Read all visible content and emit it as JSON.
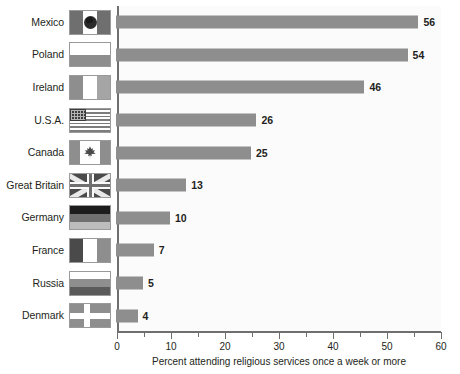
{
  "chart_data": {
    "type": "bar",
    "orientation": "horizontal",
    "title": "",
    "subtitle": "",
    "xlabel": "Percent attending religious services once a week or more",
    "ylabel": "",
    "xlim": [
      0,
      60
    ],
    "ylim": null,
    "grid": false,
    "legend": null,
    "x_ticks": [
      0,
      5,
      10,
      15,
      20,
      25,
      30,
      35,
      40,
      45,
      50,
      55,
      60
    ],
    "x_tick_labels": [
      "0",
      "",
      "10",
      "",
      "20",
      "",
      "30",
      "",
      "40",
      "",
      "50",
      "",
      "60"
    ],
    "bar_color": "#8e8e8e",
    "plot_background": "#fbfbfb",
    "axis_color": "#6f6f6f",
    "text_color": "#231f20",
    "categories": [
      "Mexico",
      "Poland",
      "Ireland",
      "U.S.A.",
      "Canada",
      "Great Britain",
      "Germany",
      "France",
      "Russia",
      "Denmark"
    ],
    "values": [
      56,
      54,
      46,
      26,
      25,
      13,
      10,
      7,
      5,
      4
    ],
    "data_labels": [
      "56",
      "54",
      "46",
      "26",
      "25",
      "13",
      "10",
      "7",
      "5",
      "4"
    ],
    "rows": [
      {
        "label": "Mexico",
        "value": 56,
        "data_label": "56",
        "flag": "flag-mexico"
      },
      {
        "label": "Poland",
        "value": 54,
        "data_label": "54",
        "flag": "flag-poland"
      },
      {
        "label": "Ireland",
        "value": 46,
        "data_label": "46",
        "flag": "flag-ireland"
      },
      {
        "label": "U.S.A.",
        "value": 26,
        "data_label": "26",
        "flag": "flag-usa"
      },
      {
        "label": "Canada",
        "value": 25,
        "data_label": "25",
        "flag": "flag-canada"
      },
      {
        "label": "Great Britain",
        "value": 13,
        "data_label": "13",
        "flag": "flag-great-britain"
      },
      {
        "label": "Germany",
        "value": 10,
        "data_label": "10",
        "flag": "flag-germany"
      },
      {
        "label": "France",
        "value": 7,
        "data_label": "7",
        "flag": "flag-france"
      },
      {
        "label": "Russia",
        "value": 5,
        "data_label": "5",
        "flag": "flag-russia"
      },
      {
        "label": "Denmark",
        "value": 4,
        "data_label": "4",
        "flag": "flag-denmark"
      }
    ]
  }
}
